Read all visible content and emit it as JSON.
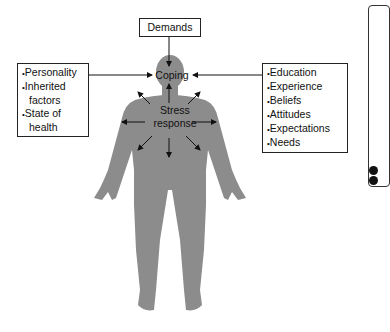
{
  "diagram": {
    "top_input": "Demands",
    "center_top": "Coping",
    "center_body_line1": "Stress",
    "center_body_line2": "response",
    "left_factors": [
      "Personality",
      "Inherited factors",
      "State of health"
    ],
    "right_factors": [
      "Education",
      "Experience",
      "Beliefs",
      "Attitudes",
      "Expectations",
      "Needs"
    ],
    "colors": {
      "figure": "#8c8c8c",
      "arrow": "#111111",
      "box_border": "#222222"
    }
  }
}
